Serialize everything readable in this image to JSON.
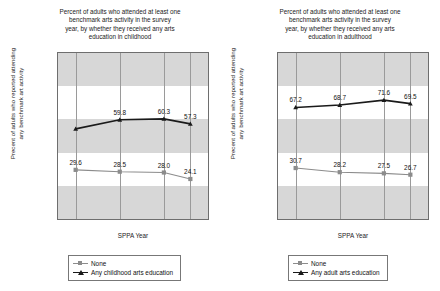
{
  "figure": {
    "panels": [
      {
        "id": "childhood",
        "title_lines": [
          "Percent of adults who attended at least one",
          "benchmark arts activity in the survey",
          "year, by whether they received any arts",
          "education in childhood"
        ],
        "ylabel_lines": [
          "Precent of adults who reported attending",
          "any benchmark art activity"
        ],
        "xlabel": "SPPA Year",
        "yticks": [
          "0%",
          "20%",
          "40%",
          "60%",
          "80%",
          "100%"
        ],
        "xticks": [
          "1982",
          "1992",
          "2002",
          "2008"
        ],
        "legend": [
          {
            "label": "None",
            "marker": "square",
            "color": "#8c8c8c"
          },
          {
            "label": "Any childhood arts education",
            "marker": "triangle",
            "color": "#1a1a1a"
          }
        ]
      },
      {
        "id": "adulthood",
        "title_lines": [
          "Percent of adults who attended at least one",
          "benchmark arts activity in the survey",
          "year, by whether they received any arts",
          "education in adulthood"
        ],
        "ylabel_lines": [
          "Precent of adults who reported attending",
          "any benchmark art activity"
        ],
        "xlabel": "SPPA Year",
        "yticks": [
          "0%",
          "20%",
          "40%",
          "60%",
          "80%",
          "100%"
        ],
        "xticks": [
          "1982",
          "1992",
          "2002",
          "2008"
        ],
        "legend": [
          {
            "label": "None",
            "marker": "square",
            "color": "#8c8c8c"
          },
          {
            "label": "Any adult arts education",
            "marker": "triangle",
            "color": "#1a1a1a"
          }
        ]
      }
    ]
  },
  "chart_data": [
    {
      "type": "line",
      "title": "Percent of adults who attended at least one benchmark arts activity in the survey year, by whether they received any arts education in childhood",
      "xlabel": "SPPA Year",
      "ylabel": "Precent of adults who reported attending any benchmark art activity",
      "x": [
        1982,
        1992,
        2002,
        2008
      ],
      "categories": [
        "1982",
        "1992",
        "2002",
        "2008"
      ],
      "xlim": [
        1978,
        2012
      ],
      "ylim": [
        0,
        100
      ],
      "ytick_values": [
        0,
        20,
        40,
        60,
        80,
        100
      ],
      "ytick_labels": [
        "0%",
        "20%",
        "40%",
        "60%",
        "80%",
        "100%"
      ],
      "grid": "vertical-gridlines-with-alternating-horizontal-bands",
      "legend_position": "below-axes",
      "series": [
        {
          "name": "Any childhood arts education",
          "color": "#1a1a1a",
          "marker": "triangle",
          "values": [
            54.3,
            59.8,
            60.3,
            57.3
          ],
          "labels": [
            "",
            "59.8",
            "60.3",
            "57.3"
          ]
        },
        {
          "name": "None",
          "color": "#8c8c8c",
          "marker": "square",
          "values": [
            29.6,
            28.5,
            28.0,
            24.1
          ],
          "labels": [
            "29.6",
            "28.5",
            "28.0",
            "24.1"
          ]
        }
      ]
    },
    {
      "type": "line",
      "title": "Percent of adults who attended at least one benchmark arts activity in the survey year, by whether they received any arts education in adulthood",
      "xlabel": "SPPA Year",
      "ylabel": "Precent of adults who reported attending any benchmark art activity",
      "x": [
        1982,
        1992,
        2002,
        2008
      ],
      "categories": [
        "1982",
        "1992",
        "2002",
        "2008"
      ],
      "xlim": [
        1978,
        2012
      ],
      "ylim": [
        0,
        100
      ],
      "ytick_values": [
        0,
        20,
        40,
        60,
        80,
        100
      ],
      "ytick_labels": [
        "0%",
        "20%",
        "40%",
        "60%",
        "80%",
        "100%"
      ],
      "grid": "vertical-gridlines-with-alternating-horizontal-bands",
      "legend_position": "below-axes",
      "series": [
        {
          "name": "Any adult arts education",
          "color": "#1a1a1a",
          "marker": "triangle",
          "values": [
            67.2,
            68.7,
            71.6,
            69.5
          ],
          "labels": [
            "67.2",
            "68.7",
            "71.6",
            "69.5"
          ]
        },
        {
          "name": "None",
          "color": "#8c8c8c",
          "marker": "square",
          "values": [
            30.7,
            28.2,
            27.5,
            26.7
          ],
          "labels": [
            "30.7",
            "28.2",
            "27.5",
            "26.7"
          ]
        }
      ]
    }
  ]
}
